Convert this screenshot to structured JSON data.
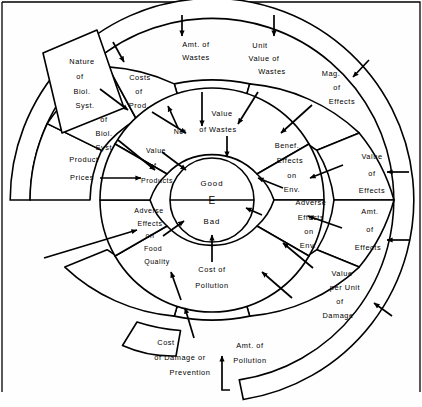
{
  "diagram": {
    "type": "concentric-ring-flow-diagram",
    "center": {
      "top_label": "Good",
      "middle_label": "E",
      "bottom_label": "Bad"
    },
    "external_box": {
      "name": "nature-of-biological-system",
      "lines": [
        "Nature",
        "of",
        "Biol.",
        "Syst."
      ]
    },
    "rings": [
      {
        "name": "ring-inner",
        "index": 1,
        "segments": [
          {
            "name": "value-of-wastes",
            "lines": [
              "Value",
              "of Wastes"
            ]
          },
          {
            "name": "benef-effects-on-env",
            "lines": [
              "Benef.",
              "Effects",
              "on",
              "Env."
            ]
          },
          {
            "name": "adverse-effects-on-env",
            "lines": [
              "Adverse",
              "Effects",
              "on",
              "Env."
            ]
          },
          {
            "name": "cost-of-pollution",
            "lines": [
              "Cost of",
              "Pollution"
            ]
          },
          {
            "name": "adverse-effects-on-food-quality",
            "lines": [
              "Adverse",
              "Effects",
              "on",
              "Food",
              "Quality"
            ]
          },
          {
            "name": "net-value-of-products",
            "lines": [
              "Net",
              "Value",
              "of",
              "Products"
            ]
          }
        ]
      },
      {
        "name": "ring-middle",
        "index": 2,
        "segments": [
          {
            "name": "unit-value-of-wastes",
            "lines": [
              "Unit",
              "Value of",
              "Wastes"
            ]
          },
          {
            "name": "mag-of-effects",
            "lines": [
              "Mag.",
              "of",
              "Effects"
            ]
          },
          {
            "name": "value-of-effects",
            "lines": [
              "Value",
              "of",
              "Effects"
            ]
          },
          {
            "name": "amt-of-effects",
            "lines": [
              "Amt.",
              "of",
              "Effects"
            ]
          },
          {
            "name": "value-per-unit-of-damage",
            "lines": [
              "Value",
              "per Unit",
              "of",
              "Damage"
            ]
          },
          {
            "name": "amt-of-pollution",
            "lines": [
              "Amt. of",
              "Pollution"
            ]
          },
          {
            "name": "cost-of-damage-or-prevention",
            "lines": [
              "Cost",
              "of  Damage or",
              "Prevention"
            ]
          },
          {
            "name": "amt-of-wastes",
            "lines": [
              "Amt. of",
              "Wastes"
            ]
          },
          {
            "name": "costs-of-prod",
            "lines": [
              "Costs",
              "of",
              "Prod."
            ]
          },
          {
            "name": "output-of-biol-syst",
            "lines": [
              "Output",
              "of",
              "Biol.",
              "Syst."
            ]
          },
          {
            "name": "product-prices",
            "lines": [
              "Product",
              "Prices"
            ]
          }
        ]
      },
      {
        "name": "ring-outer-channel",
        "index": 3,
        "segments": []
      }
    ]
  }
}
